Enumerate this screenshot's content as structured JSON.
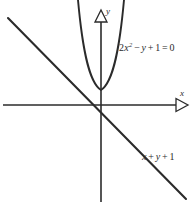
{
  "figure": {
    "background_color": "#ffffff",
    "stroke_color": "#2b2b2b",
    "width": 196,
    "height": 207
  },
  "axes": {
    "x_axis": {
      "label": "x",
      "arrowhead": "hollow-triangle-right",
      "y_pixel": 105,
      "from_x": 3,
      "to_x": 176
    },
    "y_axis": {
      "label": "y",
      "arrowhead": "hollow-triangle-up",
      "x_pixel": 101,
      "from_y": 22,
      "to_y": 202
    },
    "origin": {
      "x": 101,
      "y": 105
    }
  },
  "curves": {
    "parabola": {
      "label_parts": {
        "coefficient": "2",
        "variable": "x",
        "exponent": "2",
        "minus": "−",
        "y": "y",
        "plus": "+",
        "one": "1",
        "equals": "=",
        "zero": "0"
      },
      "label_plain": "2x2 − y + 1 = 0",
      "opens": "up",
      "vertex_pixel": {
        "x": 101,
        "y": 90
      }
    },
    "line": {
      "label_parts": {
        "x": "x",
        "plus1": "+",
        "y": "y",
        "plus2": "+",
        "one": "1"
      },
      "label_plain": "x + y + 1",
      "slope": "negative",
      "start_pixel": {
        "x": 8,
        "y": 18
      },
      "end_pixel": {
        "x": 186,
        "y": 199
      }
    }
  }
}
